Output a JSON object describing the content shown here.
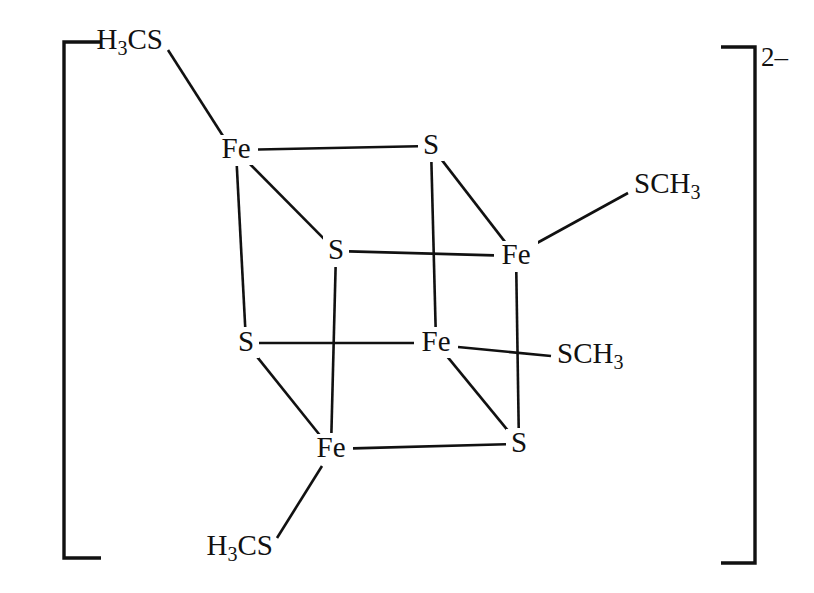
{
  "figure": {
    "overall_charge": "2–",
    "background_color": "#ffffff",
    "line_color": "#111111"
  },
  "brackets": {
    "left": {
      "name": "left-square-bracket",
      "x": 64,
      "top": 42,
      "bottom": 558,
      "arm": 37
    },
    "right": {
      "name": "right-square-bracket",
      "x": 755,
      "top": 47,
      "bottom": 563,
      "arm": 34
    },
    "charge": {
      "text": "2–",
      "x": 761,
      "y": 47
    }
  },
  "cube": {
    "vertices": [
      {
        "id": "fe-top-left",
        "label": "Fe",
        "x": 236,
        "y": 150
      },
      {
        "id": "s-top-right",
        "label": "S",
        "x": 431,
        "y": 146
      },
      {
        "id": "s-inner-left",
        "label": "S",
        "x": 336,
        "y": 251
      },
      {
        "id": "fe-right",
        "label": "Fe",
        "x": 516,
        "y": 256
      },
      {
        "id": "s-lower-left",
        "label": "S",
        "x": 246,
        "y": 343
      },
      {
        "id": "fe-center",
        "label": "Fe",
        "x": 436,
        "y": 343
      },
      {
        "id": "fe-bottom-left",
        "label": "Fe",
        "x": 331,
        "y": 449
      },
      {
        "id": "s-bottom-right",
        "label": "S",
        "x": 519,
        "y": 444
      }
    ],
    "edges": [
      {
        "id": "edge-fe-top-left--s-top-right",
        "from": "fe-top-left",
        "to": "s-top-right"
      },
      {
        "id": "edge-fe-top-left--s-inner-left",
        "from": "fe-top-left",
        "to": "s-inner-left"
      },
      {
        "id": "edge-fe-top-left--s-lower-left",
        "from": "fe-top-left",
        "to": "s-lower-left"
      },
      {
        "id": "edge-s-top-right--fe-right",
        "from": "s-top-right",
        "to": "fe-right"
      },
      {
        "id": "edge-s-top-right--fe-center",
        "from": "s-top-right",
        "to": "fe-center"
      },
      {
        "id": "edge-s-inner-left--fe-right",
        "from": "s-inner-left",
        "to": "fe-right"
      },
      {
        "id": "edge-s-inner-left--fe-bottom-left",
        "from": "s-inner-left",
        "to": "fe-bottom-left"
      },
      {
        "id": "edge-fe-right--s-bottom-right",
        "from": "fe-right",
        "to": "s-bottom-right"
      },
      {
        "id": "edge-s-lower-left--fe-center",
        "from": "s-lower-left",
        "to": "fe-center"
      },
      {
        "id": "edge-s-lower-left--fe-bottom-left",
        "from": "s-lower-left",
        "to": "fe-bottom-left"
      },
      {
        "id": "edge-fe-center--s-bottom-right",
        "from": "fe-center",
        "to": "s-bottom-right"
      },
      {
        "id": "edge-fe-bottom-left--s-bottom-right",
        "from": "fe-bottom-left",
        "to": "s-bottom-right"
      }
    ]
  },
  "ligands": [
    {
      "id": "ligand-top-left",
      "name": "thiomethyl-ligand-top-left",
      "text_prefix": "H",
      "text_sub": "3",
      "text_suffix": "CS",
      "full_text": "H3CS",
      "anchor": "end",
      "label_x": 163,
      "label_y": 42,
      "bond": {
        "x1": 168,
        "y1": 50,
        "x2": 223,
        "y2": 136
      },
      "attached_to": "fe-top-left"
    },
    {
      "id": "ligand-top-right",
      "name": "thiomethyl-ligand-top-right",
      "text_prefix": "SCH",
      "text_sub": "3",
      "text_suffix": "",
      "full_text": "SCH3",
      "anchor": "start",
      "label_x": 634,
      "label_y": 186,
      "bond": {
        "x1": 537,
        "y1": 243,
        "x2": 628,
        "y2": 193
      },
      "attached_to": "fe-right"
    },
    {
      "id": "ligand-middle-right",
      "name": "thiomethyl-ligand-middle-right",
      "text_prefix": "SCH",
      "text_sub": "3",
      "text_suffix": "",
      "full_text": "SCH3",
      "anchor": "start",
      "label_x": 557,
      "label_y": 356,
      "bond": {
        "x1": 458,
        "y1": 347,
        "x2": 551,
        "y2": 356
      },
      "attached_to": "fe-center"
    },
    {
      "id": "ligand-bottom-left",
      "name": "thiomethyl-ligand-bottom-left",
      "text_prefix": "H",
      "text_sub": "3",
      "text_suffix": "CS",
      "full_text": "H3CS",
      "anchor": "end",
      "label_x": 273,
      "label_y": 548,
      "bond": {
        "x1": 277,
        "y1": 538,
        "x2": 322,
        "y2": 466
      },
      "attached_to": "fe-bottom-left"
    }
  ],
  "chart_data": {
    "type": "diagram",
    "atoms": [
      {
        "label": "Fe",
        "position": "top-left-front"
      },
      {
        "label": "S",
        "position": "top-right-back"
      },
      {
        "label": "S",
        "position": "upper-inner-left"
      },
      {
        "label": "Fe",
        "position": "middle-right-back"
      },
      {
        "label": "S",
        "position": "lower-left-front"
      },
      {
        "label": "Fe",
        "position": "center-inner"
      },
      {
        "label": "Fe",
        "position": "bottom-left-front"
      },
      {
        "label": "S",
        "position": "bottom-right-back"
      }
    ],
    "terminal_ligands": [
      "H3CS",
      "SCH3",
      "SCH3",
      "H3CS"
    ],
    "charge": "2-"
  }
}
